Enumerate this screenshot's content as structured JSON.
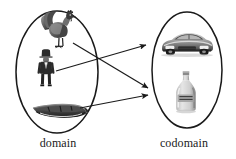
{
  "figure": {
    "type": "function-mapping-diagram",
    "background_color": "#ffffff",
    "stroke_color": "#1a1a1a"
  },
  "domain": {
    "label": "domain",
    "ellipse": {
      "cx": 57,
      "cy": 72,
      "rx": 41,
      "ry": 61
    },
    "elements": [
      {
        "id": "rooster",
        "icon_name": "rooster-image",
        "label": "rooster",
        "x": 58,
        "y": 32
      },
      {
        "id": "man",
        "icon_name": "man-in-hat-image",
        "label": "man in hat",
        "x": 46,
        "y": 70
      },
      {
        "id": "boat",
        "icon_name": "boat-image",
        "label": "boat",
        "x": 60,
        "y": 111
      }
    ]
  },
  "codomain": {
    "label": "codomain",
    "ellipse": {
      "cx": 187,
      "cy": 70,
      "rx": 35,
      "ry": 58
    },
    "elements": [
      {
        "id": "car",
        "icon_name": "car-image",
        "label": "car",
        "x": 187,
        "y": 45
      },
      {
        "id": "bottle",
        "icon_name": "bottle-image",
        "label": "bottle",
        "x": 186,
        "y": 94
      }
    ]
  },
  "mappings": [
    {
      "from": "rooster",
      "to": "bottle",
      "x1": 73,
      "y1": 43,
      "x2": 150,
      "y2": 88
    },
    {
      "from": "man",
      "to": "car",
      "x1": 56,
      "y1": 71,
      "x2": 148,
      "y2": 45
    },
    {
      "from": "boat",
      "to": "bottle",
      "x1": 80,
      "y1": 108,
      "x2": 150,
      "y2": 95
    }
  ],
  "colors": {
    "outline": "#1a1a1a",
    "arrow": "#2a2a2a",
    "text": "#1a1a1a",
    "image_dark": "#2e2e2e",
    "image_mid": "#7a7a7a",
    "image_light": "#c9c9c9"
  }
}
